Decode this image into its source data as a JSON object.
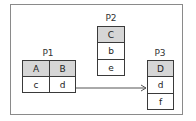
{
  "diagram": {
    "tables": [
      {
        "name": "P1",
        "header": [
          "A",
          "B"
        ],
        "rows": [
          [
            "c",
            "d"
          ]
        ]
      },
      {
        "name": "P2",
        "header": [
          "C"
        ],
        "rows": [
          [
            "b"
          ],
          [
            "e"
          ]
        ]
      },
      {
        "name": "P3",
        "header": [
          "D"
        ],
        "rows": [
          [
            "d"
          ],
          [
            "f"
          ]
        ]
      }
    ],
    "edges": [
      {
        "from": "P1.d",
        "to": "P3.d"
      }
    ],
    "colors": {
      "header_fill": "#d6d6d6",
      "border": "#3a3a3a",
      "frame": "#8a8a8a"
    }
  }
}
